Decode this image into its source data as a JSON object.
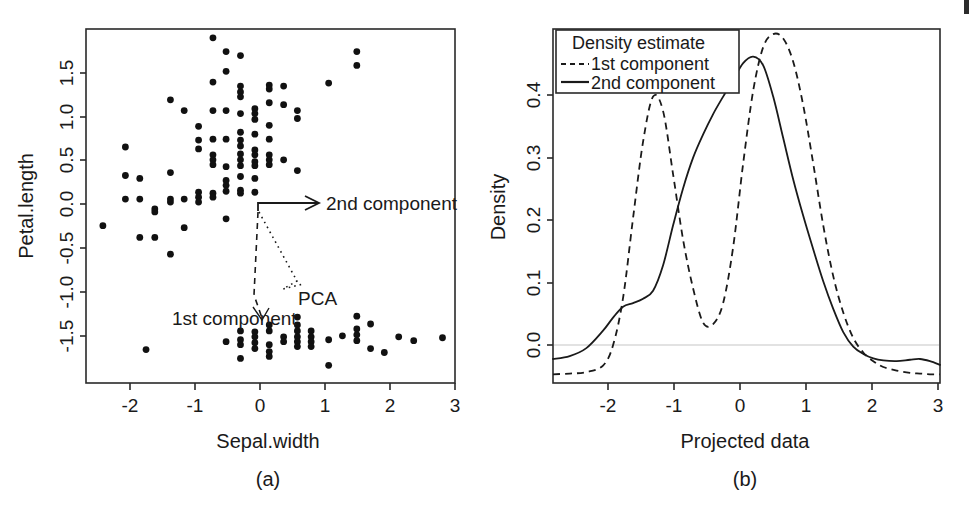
{
  "figure": {
    "background": "#ffffff",
    "ink_color": "#1a1a1a"
  },
  "panel_a": {
    "label": "(a)",
    "xlabel": "Sepal.width",
    "ylabel": "Petal.length",
    "xticks": [
      "-2",
      "-1",
      "0",
      "1",
      "2",
      "3"
    ],
    "yticks": [
      "1.5",
      "1.0",
      "0.5",
      "0.0",
      "-0.5",
      "-1.0",
      "-1.5"
    ],
    "annotations": {
      "second_component": "2nd component",
      "first_component": "1st component",
      "pca": "PCA"
    }
  },
  "panel_b": {
    "label": "(b)",
    "xlabel": "Projected data",
    "ylabel": "Density",
    "xticks": [
      "-2",
      "-1",
      "0",
      "1",
      "2",
      "3"
    ],
    "yticks": [
      "0.4",
      "0.3",
      "0.2",
      "0.1",
      "0.0"
    ],
    "legend": {
      "title": "Density estimate",
      "entries": [
        {
          "label": "1st component",
          "style": "dashed"
        },
        {
          "label": "2nd component",
          "style": "solid"
        }
      ]
    }
  },
  "chart_data": [
    {
      "type": "scatter",
      "title": "(a)",
      "xlabel": "Sepal.width",
      "ylabel": "Petal.length",
      "xlim": [
        -2.6,
        3.3
      ],
      "ylim": [
        -1.75,
        1.85
      ],
      "grid": false,
      "legend": "none",
      "annotations": [
        {
          "text": "2nd component",
          "x": 0.95,
          "y": 0.05
        },
        {
          "text": "1st component",
          "x": -0.6,
          "y": -1.12
        },
        {
          "text": "PCA",
          "x": 0.62,
          "y": -0.78
        }
      ],
      "points": [
        [
          -2.33,
          -0.15
        ],
        [
          -1.97,
          0.65
        ],
        [
          -1.97,
          0.36
        ],
        [
          -1.97,
          0.12
        ],
        [
          -1.74,
          0.33
        ],
        [
          -1.74,
          0.12
        ],
        [
          -1.74,
          -0.27
        ],
        [
          -1.64,
          -1.41
        ],
        [
          -1.5,
          0.02
        ],
        [
          -1.5,
          -0.01
        ],
        [
          -1.5,
          -0.27
        ],
        [
          -1.25,
          1.13
        ],
        [
          -1.25,
          0.39
        ],
        [
          -1.25,
          0.12
        ],
        [
          -1.25,
          0.09
        ],
        [
          -1.25,
          -0.44
        ],
        [
          -1.03,
          1.02
        ],
        [
          -1.03,
          0.12
        ],
        [
          -1.03,
          -0.17
        ],
        [
          -0.8,
          0.86
        ],
        [
          -0.8,
          0.72
        ],
        [
          -0.8,
          0.63
        ],
        [
          -0.8,
          0.19
        ],
        [
          -0.8,
          0.14
        ],
        [
          -0.8,
          0.09
        ],
        [
          -0.57,
          1.76
        ],
        [
          -0.57,
          1.31
        ],
        [
          -0.57,
          1.02
        ],
        [
          -0.57,
          0.73
        ],
        [
          -0.57,
          0.57
        ],
        [
          -0.57,
          0.52
        ],
        [
          -0.57,
          0.47
        ],
        [
          -0.57,
          0.18
        ],
        [
          -0.57,
          0.14
        ],
        [
          -0.36,
          1.62
        ],
        [
          -0.36,
          1.42
        ],
        [
          -0.36,
          1.02
        ],
        [
          -0.36,
          0.73
        ],
        [
          -0.36,
          0.45
        ],
        [
          -0.36,
          0.31
        ],
        [
          -0.36,
          0.26
        ],
        [
          -0.36,
          0.2
        ],
        [
          -0.36,
          -0.08
        ],
        [
          -0.36,
          -1.33
        ],
        [
          -0.13,
          1.58
        ],
        [
          -0.13,
          1.27
        ],
        [
          -0.13,
          1.21
        ],
        [
          -0.13,
          1.16
        ],
        [
          -0.13,
          0.99
        ],
        [
          -0.13,
          0.8
        ],
        [
          -0.13,
          0.72
        ],
        [
          -0.13,
          0.66
        ],
        [
          -0.13,
          0.58
        ],
        [
          -0.13,
          0.52
        ],
        [
          -0.13,
          0.46
        ],
        [
          -0.13,
          0.35
        ],
        [
          -0.13,
          0.21
        ],
        [
          -0.13,
          0.18
        ],
        [
          -0.13,
          -1.22
        ],
        [
          -0.13,
          -1.31
        ],
        [
          -0.13,
          -1.36
        ],
        [
          -0.13,
          -1.5
        ],
        [
          0.1,
          1.04
        ],
        [
          0.1,
          0.99
        ],
        [
          0.1,
          0.93
        ],
        [
          0.1,
          0.78
        ],
        [
          0.1,
          0.62
        ],
        [
          0.1,
          0.57
        ],
        [
          0.1,
          0.5
        ],
        [
          0.1,
          0.46
        ],
        [
          0.1,
          0.33
        ],
        [
          0.1,
          0.19
        ],
        [
          0.1,
          -1.23
        ],
        [
          0.1,
          -1.28
        ],
        [
          0.1,
          -1.34
        ],
        [
          0.1,
          -1.4
        ],
        [
          0.33,
          1.28
        ],
        [
          0.33,
          1.24
        ],
        [
          0.33,
          1.1
        ],
        [
          0.33,
          0.87
        ],
        [
          0.33,
          0.73
        ],
        [
          0.33,
          0.57
        ],
        [
          0.33,
          0.52
        ],
        [
          0.33,
          0.47
        ],
        [
          0.33,
          -1.16
        ],
        [
          0.33,
          -1.22
        ],
        [
          0.33,
          -1.36
        ],
        [
          0.33,
          -1.43
        ],
        [
          0.33,
          -1.48
        ],
        [
          0.56,
          1.27
        ],
        [
          0.56,
          1.08
        ],
        [
          0.56,
          0.52
        ],
        [
          0.56,
          -1.28
        ],
        [
          0.56,
          -1.33
        ],
        [
          0.78,
          1.02
        ],
        [
          0.78,
          0.94
        ],
        [
          0.78,
          0.41
        ],
        [
          0.78,
          -1.08
        ],
        [
          0.78,
          -1.16
        ],
        [
          0.78,
          -1.22
        ],
        [
          0.78,
          -1.28
        ],
        [
          0.78,
          -1.33
        ],
        [
          0.78,
          -1.38
        ],
        [
          1.0,
          -1.22
        ],
        [
          1.0,
          -1.28
        ],
        [
          1.0,
          -1.33
        ],
        [
          1.0,
          -1.38
        ],
        [
          1.28,
          1.3
        ],
        [
          1.28,
          -1.31
        ],
        [
          1.28,
          -1.57
        ],
        [
          1.5,
          -1.27
        ],
        [
          1.73,
          1.62
        ],
        [
          1.73,
          1.48
        ],
        [
          1.73,
          -1.07
        ],
        [
          1.73,
          -1.2
        ],
        [
          1.73,
          -1.26
        ],
        [
          1.73,
          -1.32
        ],
        [
          1.95,
          -1.15
        ],
        [
          1.95,
          -1.4
        ],
        [
          2.17,
          -1.44
        ],
        [
          2.4,
          -1.28
        ],
        [
          2.64,
          -1.32
        ],
        [
          3.1,
          -1.29
        ]
      ]
    },
    {
      "type": "line",
      "title": "(b)",
      "xlabel": "Projected data",
      "ylabel": "Density",
      "xlim": [
        -2.75,
        3.05
      ],
      "ylim": [
        -0.012,
        0.475
      ],
      "grid": false,
      "legend": "top-left",
      "legend_title": "Density estimate",
      "x": [
        -2.75,
        -2.5,
        -2.25,
        -2.0,
        -1.85,
        -1.7,
        -1.55,
        -1.4,
        -1.25,
        -1.1,
        -0.95,
        -0.8,
        -0.65,
        -0.5,
        -0.35,
        -0.2,
        -0.05,
        0.1,
        0.25,
        0.4,
        0.55,
        0.7,
        0.85,
        1.0,
        1.15,
        1.3,
        1.45,
        1.6,
        1.75,
        1.9,
        2.05,
        2.2,
        2.4,
        2.6,
        2.75,
        2.9,
        3.05
      ],
      "series": [
        {
          "name": "1st component",
          "style": "dashed",
          "values": [
            0.0,
            0.001,
            0.003,
            0.012,
            0.04,
            0.105,
            0.215,
            0.32,
            0.382,
            0.362,
            0.275,
            0.185,
            0.118,
            0.071,
            0.069,
            0.098,
            0.175,
            0.29,
            0.39,
            0.45,
            0.468,
            0.462,
            0.43,
            0.37,
            0.29,
            0.205,
            0.135,
            0.085,
            0.05,
            0.03,
            0.018,
            0.01,
            0.005,
            0.002,
            0.001,
            0.0,
            0.0
          ]
        },
        {
          "name": "2nd component",
          "style": "solid",
          "values": [
            0.021,
            0.025,
            0.036,
            0.06,
            0.078,
            0.093,
            0.098,
            0.104,
            0.115,
            0.15,
            0.205,
            0.256,
            0.298,
            0.33,
            0.358,
            0.382,
            0.405,
            0.428,
            0.437,
            0.425,
            0.382,
            0.325,
            0.268,
            0.218,
            0.172,
            0.128,
            0.09,
            0.058,
            0.038,
            0.028,
            0.022,
            0.019,
            0.018,
            0.02,
            0.021,
            0.018,
            0.013
          ]
        }
      ]
    }
  ]
}
